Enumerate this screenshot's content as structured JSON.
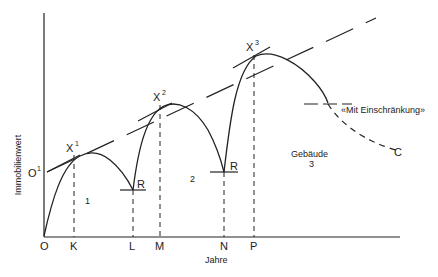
{
  "diagram": {
    "y_axis_label": "Immobilienwert",
    "x_axis_label": "Jahre",
    "origin_label": "O",
    "start_value_label": "O",
    "start_value_sup": "1",
    "x_ticks": [
      "K",
      "L",
      "M",
      "N",
      "P"
    ],
    "peaks": [
      {
        "label": "X",
        "sup": "1"
      },
      {
        "label": "X",
        "sup": "2"
      },
      {
        "label": "X",
        "sup": "3"
      }
    ],
    "renovation_label_1": "R",
    "renovation_label_2": "R",
    "phase_labels": [
      "1",
      "2",
      "3"
    ],
    "building_label": "Gebäude",
    "annotation": "«Mit Einschränkung»",
    "curve_end_label": "C"
  }
}
